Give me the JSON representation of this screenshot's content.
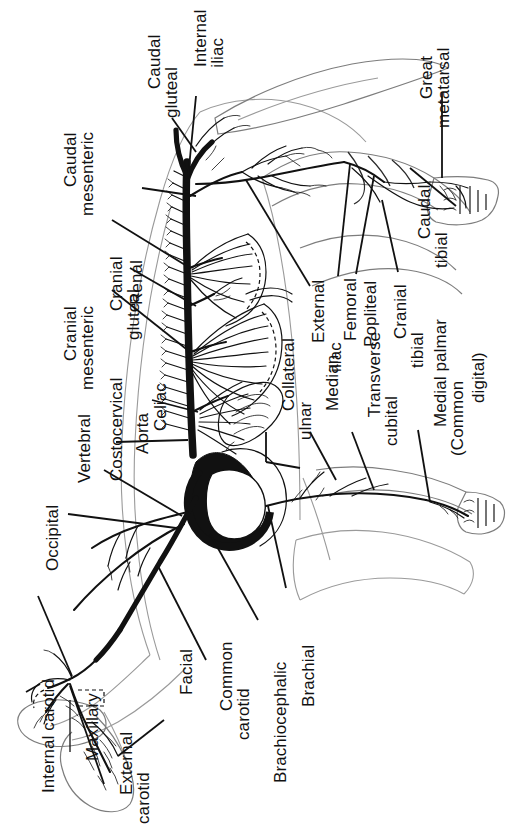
{
  "figure": {
    "orientation": "sideways (text rotated 90 degrees counter-clockwise)",
    "ink_color": "#111111",
    "paper_color": "#ffffff"
  },
  "labels": [
    {
      "id": "caudal-mesenteric",
      "line1": "Caudal",
      "line2": "mesenteric"
    },
    {
      "id": "cranial-gluteal",
      "line1": "Cranial",
      "line2": "gluteal"
    },
    {
      "id": "caudal-gluteal",
      "line1": "Caudal",
      "line2": "gluteal"
    },
    {
      "id": "internal-iliac",
      "line1": "Internal",
      "line2": "iliac"
    },
    {
      "id": "great-metatarsal",
      "line1": "Great",
      "line2": "metatarsal"
    },
    {
      "id": "cranial-mesenteric",
      "line1": "Cranial",
      "line2": "mesenteric"
    },
    {
      "id": "renal",
      "line1": "Renal",
      "line2": ""
    },
    {
      "id": "celiac",
      "line1": "Celiac",
      "line2": ""
    },
    {
      "id": "caudal-tibial",
      "line1": "Caudal",
      "line2": "tibial"
    },
    {
      "id": "external-iliac",
      "line1": "External",
      "line2": "iliac"
    },
    {
      "id": "femoral",
      "line1": "Femoral",
      "line2": ""
    },
    {
      "id": "popliteal",
      "line1": "Popliteal",
      "line2": ""
    },
    {
      "id": "cranial-tibial",
      "line1": "Cranial",
      "line2": "tibial"
    },
    {
      "id": "costocervical",
      "line1": "Costocervical",
      "line2": ""
    },
    {
      "id": "aorta",
      "line1": "Aorta",
      "line2": ""
    },
    {
      "id": "vertebral",
      "line1": "Vertebral",
      "line2": ""
    },
    {
      "id": "occipital",
      "line1": "Occipital",
      "line2": ""
    },
    {
      "id": "collateral-ulnar",
      "line1": "Collateral",
      "line2": "ulnar"
    },
    {
      "id": "median",
      "line1": "Median",
      "line2": ""
    },
    {
      "id": "transverse-cubital",
      "line1": "Transverse",
      "line2": "cubital"
    },
    {
      "id": "medial-palmar",
      "line1": "Medial palmar",
      "line2": "(Common"
    },
    {
      "id": "medial-palmar-2",
      "line1": "digital)",
      "line2": ""
    },
    {
      "id": "internal-carotid",
      "line1": "Internal carotid",
      "line2": ""
    },
    {
      "id": "maxillary",
      "line1": "Maxillary",
      "line2": ""
    },
    {
      "id": "external-carotid",
      "line1": "External",
      "line2": "carotid"
    },
    {
      "id": "facial",
      "line1": "Facial",
      "line2": ""
    },
    {
      "id": "common-carotid",
      "line1": "Common",
      "line2": "carotid"
    },
    {
      "id": "brachiocephalic",
      "line1": "Brachiocephalic",
      "line2": ""
    },
    {
      "id": "brachial",
      "line1": "Brachial",
      "line2": ""
    }
  ]
}
